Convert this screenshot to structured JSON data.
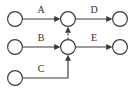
{
  "diagram": {
    "background_color": "#ffffff",
    "stroke_color": "#3a3a3a",
    "label_color": "#2e2e2e",
    "width": 135,
    "height": 93,
    "nodes": [
      {
        "id": "n1",
        "name": "node-top-left",
        "cx": 15,
        "cy": 19,
        "r": 7.4
      },
      {
        "id": "n2",
        "name": "node-top-middle",
        "cx": 68,
        "cy": 19,
        "r": 7.4
      },
      {
        "id": "n3",
        "name": "node-top-right",
        "cx": 120,
        "cy": 19,
        "r": 7.4
      },
      {
        "id": "n4",
        "name": "node-mid-left",
        "cx": 15,
        "cy": 47,
        "r": 7.4
      },
      {
        "id": "n5",
        "name": "node-mid-middle",
        "cx": 68,
        "cy": 47,
        "r": 7.4
      },
      {
        "id": "n6",
        "name": "node-mid-right",
        "cx": 120,
        "cy": 47,
        "r": 7.4
      },
      {
        "id": "n7",
        "name": "node-bottom-left",
        "cx": 15,
        "cy": 78,
        "r": 7.4
      }
    ],
    "edges": [
      {
        "id": "e-a",
        "name": "edge-a",
        "label": "A",
        "from": "n1",
        "to": "n2",
        "style": "solid",
        "label_x": 41,
        "label_y": 13
      },
      {
        "id": "e-d",
        "name": "edge-d",
        "label": "D",
        "from": "n2",
        "to": "n3",
        "style": "solid",
        "label_x": 94,
        "label_y": 13
      },
      {
        "id": "e-b",
        "name": "edge-b",
        "label": "B",
        "from": "n4",
        "to": "n5",
        "style": "solid",
        "label_x": 41,
        "label_y": 41
      },
      {
        "id": "e-e",
        "name": "edge-e",
        "label": "E",
        "from": "n5",
        "to": "n6",
        "style": "solid",
        "label_x": 94,
        "label_y": 41
      },
      {
        "id": "e-c",
        "name": "edge-c",
        "label": "C",
        "from": "n7",
        "to": "n5",
        "style": "solid-elbow",
        "label_x": 41,
        "label_y": 72
      },
      {
        "id": "e-dashed",
        "name": "edge-dashed-mid-to-top",
        "label": "",
        "from": "n5",
        "to": "n2",
        "style": "dashed",
        "label_x": 0,
        "label_y": 0
      }
    ],
    "labels": {
      "a": "A",
      "b": "B",
      "c": "C",
      "d": "D",
      "e": "E"
    }
  }
}
